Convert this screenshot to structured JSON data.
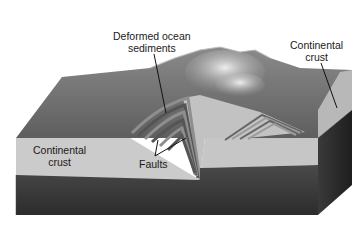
{
  "diagram": {
    "title": "",
    "style": "grayscale 3D block diagram",
    "labels": {
      "deformed_sediments_line1": "Deformed ocean",
      "deformed_sediments_line2": "sediments",
      "continental_crust_right_line1": "Continental",
      "continental_crust_right_line2": "crust",
      "continental_crust_left_line1": "Continental",
      "continental_crust_left_line2": "crust",
      "faults": "Faults"
    },
    "colors": {
      "surface": "#6e6e6e",
      "mountain_highlight": "#d8d8d8",
      "crust": "#c9c9c9",
      "mantle": "#3a3a3a",
      "side_face": "#2a2a2a",
      "fold_dark": "#555555",
      "fold_light": "#9a9a9a",
      "leader_line": "#111111"
    }
  }
}
